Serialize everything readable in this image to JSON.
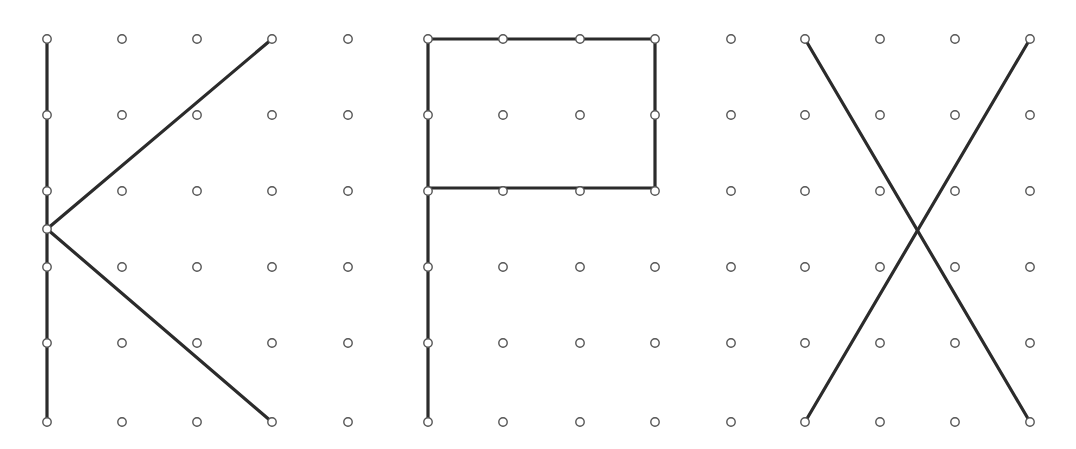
{
  "page": {
    "width": 1076,
    "height": 449,
    "background_color": "#ffffff"
  },
  "style": {
    "peg_stroke_color": "#555555",
    "peg_fill_color": "#ffffff",
    "peg_radius": 4.2,
    "peg_stroke_width": 1.4,
    "band_color": "#2b2b2b",
    "band_width": 3.2
  },
  "grid": {
    "rows_y": [
      39,
      115,
      191,
      267,
      343,
      422
    ],
    "row_count": 6,
    "panels": [
      {
        "name": "panel-k",
        "label": "K",
        "columns_x": [
          47,
          122,
          197,
          272,
          348
        ],
        "column_count": 5,
        "extra_pegs": [
          [
            47,
            229
          ]
        ]
      },
      {
        "name": "panel-p",
        "label": "P",
        "columns_x": [
          428,
          503,
          580,
          655,
          731
        ],
        "column_count": 5,
        "extra_pegs": []
      },
      {
        "name": "panel-x",
        "label": "X",
        "columns_x": [
          805,
          880,
          955,
          1030
        ],
        "column_count": 4,
        "extra_pegs": []
      }
    ]
  },
  "shapes": [
    {
      "name": "shape-k",
      "label": "K",
      "panel": "panel-k",
      "paths": [
        {
          "name": "k-vertical-stroke",
          "points": [
            [
              47,
              39
            ],
            [
              47,
              422
            ]
          ]
        },
        {
          "name": "k-upper-diagonal",
          "points": [
            [
              47,
              229
            ],
            [
              272,
              39
            ]
          ]
        },
        {
          "name": "k-lower-diagonal",
          "points": [
            [
              47,
              229
            ],
            [
              272,
              422
            ]
          ]
        }
      ]
    },
    {
      "name": "shape-p",
      "label": "P",
      "panel": "panel-p",
      "paths": [
        {
          "name": "p-vertical-stem",
          "points": [
            [
              428,
              39
            ],
            [
              428,
              422
            ]
          ]
        },
        {
          "name": "p-bowl-rectangle",
          "points": [
            [
              428,
              39
            ],
            [
              655,
              39
            ],
            [
              655,
              188
            ],
            [
              428,
              188
            ]
          ]
        }
      ]
    },
    {
      "name": "shape-x",
      "label": "X",
      "panel": "panel-x",
      "paths": [
        {
          "name": "x-diagonal-nw-se",
          "points": [
            [
              805,
              39
            ],
            [
              1030,
              422
            ]
          ]
        },
        {
          "name": "x-diagonal-ne-sw",
          "points": [
            [
              1030,
              39
            ],
            [
              805,
              422
            ]
          ]
        }
      ]
    }
  ],
  "chart_data": {
    "type": "scatter",
    "xlabel": "",
    "ylabel": "",
    "grid": false,
    "legend": "none",
    "xlim": [
      0,
      1076
    ],
    "ylim": [
      449,
      0
    ],
    "series": [
      {
        "name": "pegs-panel-k",
        "marker": "open-circle",
        "x": [
          47,
          122,
          197,
          272,
          348,
          47,
          122,
          197,
          272,
          348,
          47,
          122,
          197,
          272,
          348,
          47,
          47,
          122,
          197,
          272,
          348,
          47,
          122,
          197,
          272,
          348,
          47,
          122,
          197,
          272,
          348
        ],
        "y": [
          39,
          39,
          39,
          39,
          39,
          115,
          115,
          115,
          115,
          115,
          191,
          191,
          191,
          191,
          191,
          229,
          267,
          267,
          267,
          267,
          267,
          343,
          343,
          343,
          343,
          343,
          422,
          422,
          422,
          422,
          422
        ]
      },
      {
        "name": "pegs-panel-p",
        "marker": "open-circle",
        "x": [
          428,
          503,
          580,
          655,
          731,
          428,
          503,
          580,
          655,
          731,
          428,
          503,
          580,
          655,
          731,
          428,
          503,
          580,
          655,
          731,
          428,
          503,
          580,
          655,
          731,
          428,
          503,
          580,
          655,
          731
        ],
        "y": [
          39,
          39,
          39,
          39,
          39,
          115,
          115,
          115,
          115,
          115,
          188,
          188,
          188,
          188,
          188,
          267,
          267,
          267,
          267,
          267,
          343,
          343,
          343,
          343,
          343,
          422,
          422,
          422,
          422,
          422
        ]
      },
      {
        "name": "pegs-panel-x",
        "marker": "open-circle",
        "x": [
          805,
          880,
          955,
          1030,
          805,
          880,
          955,
          1030,
          805,
          880,
          955,
          1030,
          805,
          880,
          955,
          1030,
          805,
          880,
          955,
          1030,
          805,
          880,
          955,
          1030
        ],
        "y": [
          39,
          39,
          39,
          39,
          115,
          115,
          115,
          115,
          191,
          191,
          191,
          191,
          267,
          267,
          267,
          267,
          343,
          343,
          343,
          343,
          422,
          422,
          422,
          422
        ]
      }
    ]
  }
}
